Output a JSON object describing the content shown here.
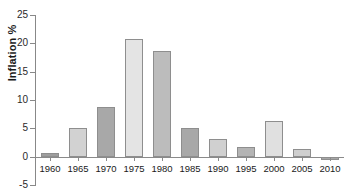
{
  "chart_data": {
    "type": "bar",
    "title": "",
    "xlabel": "",
    "ylabel": "Inflation %",
    "categories": [
      "1960",
      "1965",
      "1970",
      "1975",
      "1980",
      "1985",
      "1990",
      "1995",
      "2000",
      "2005",
      "2010"
    ],
    "values": [
      0.7,
      5.1,
      8.7,
      20.7,
      18.7,
      5.1,
      3.2,
      1.7,
      6.3,
      1.3,
      -0.6
    ],
    "ylim": [
      -5,
      25
    ],
    "yticks": [
      -5,
      0,
      5,
      10,
      15,
      20,
      25
    ],
    "ytick_labels": [
      "-5",
      "0",
      "5",
      "10",
      "15",
      "20",
      "25"
    ],
    "grid": false,
    "legend": false,
    "bar_colors": [
      "#9e9e9e",
      "#d2d2d2",
      "#a8a8a8",
      "#e4e4e4",
      "#bcbcbc",
      "#a8a8a8",
      "#d0d0d0",
      "#b4b4b4",
      "#e0e0e0",
      "#cfcfcf",
      "#a6a6a6"
    ],
    "bar_border_color": "#8e8e8e",
    "axis_color": "#8a8a8a",
    "text_color": "#1a1a1a"
  }
}
